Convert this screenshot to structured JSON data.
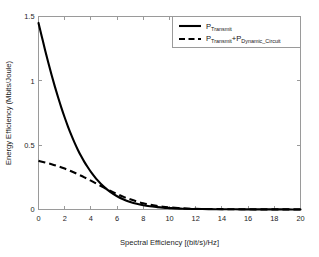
{
  "chart_data": {
    "type": "line",
    "title": "",
    "xlabel": "Spectral Efficiency [(bit/s)/Hz]",
    "ylabel": "Energy Efficiency (Mbits/Joule)",
    "xlim": [
      0,
      20
    ],
    "ylim": [
      0,
      1.5
    ],
    "grid": false,
    "legend_position": "upper right",
    "xticks": [
      0,
      2,
      4,
      6,
      8,
      10,
      12,
      14,
      16,
      18,
      20
    ],
    "xtick_labels": [
      "0",
      "2",
      "4",
      "6",
      "8",
      "10",
      "12",
      "14",
      "16",
      "18",
      "20"
    ],
    "yticks": [
      0,
      0.5,
      1,
      1.5
    ],
    "ytick_labels": [
      "0",
      "0.5",
      "1",
      "1.5"
    ],
    "series": [
      {
        "name": "P_Transmit",
        "legend_base": "P",
        "legend_sub": "Transmit",
        "style": "solid",
        "color": "#000000",
        "x": [
          0,
          0.25,
          0.5,
          0.75,
          1,
          1.25,
          1.5,
          1.75,
          2,
          2.25,
          2.5,
          2.75,
          3,
          3.25,
          3.5,
          3.75,
          4,
          4.5,
          5,
          5.5,
          6,
          6.5,
          7,
          7.5,
          8,
          8.5,
          9,
          9.5,
          10,
          11,
          12,
          13,
          14,
          15,
          16,
          17,
          18,
          19,
          20
        ],
        "y": [
          1.45,
          1.345,
          1.24,
          1.14,
          1.045,
          0.955,
          0.87,
          0.79,
          0.715,
          0.645,
          0.58,
          0.52,
          0.465,
          0.415,
          0.37,
          0.33,
          0.293,
          0.228,
          0.176,
          0.135,
          0.103,
          0.078,
          0.059,
          0.044,
          0.033,
          0.025,
          0.019,
          0.014,
          0.011,
          0.006,
          0.004,
          0.003,
          0.002,
          0.0015,
          0.001,
          0.001,
          0.0008,
          0.0006,
          0.0005
        ]
      },
      {
        "name": "P_Transmit+P_Dynamic_Circuit",
        "legend_base_1": "P",
        "legend_sub_1": "Transmit",
        "legend_plus": "+P",
        "legend_sub_2": "Dynamic_Circuit",
        "style": "dashed",
        "color": "#000000",
        "x": [
          0,
          0.5,
          1,
          1.5,
          2,
          2.5,
          3,
          3.5,
          4,
          4.5,
          5,
          5.5,
          6,
          6.5,
          7,
          7.5,
          8,
          8.5,
          9,
          9.5,
          10,
          11,
          12,
          13,
          14,
          15,
          16,
          17,
          18,
          19,
          20
        ],
        "y": [
          0.378,
          0.366,
          0.352,
          0.336,
          0.318,
          0.297,
          0.274,
          0.25,
          0.224,
          0.197,
          0.17,
          0.144,
          0.12,
          0.098,
          0.079,
          0.062,
          0.048,
          0.037,
          0.028,
          0.021,
          0.016,
          0.009,
          0.005,
          0.004,
          0.003,
          0.002,
          0.0015,
          0.001,
          0.001,
          0.0008,
          0.0006
        ]
      }
    ]
  }
}
